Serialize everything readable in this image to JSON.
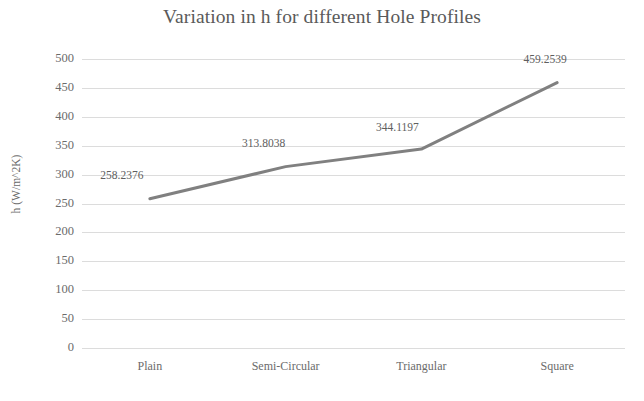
{
  "chart_data": {
    "type": "line",
    "title": "Variation in h for different Hole Profiles",
    "xlabel": "",
    "ylabel": "h (W/m^2K)",
    "categories": [
      "Plain",
      "Semi-Circular",
      "Triangular",
      "Square"
    ],
    "values": [
      258.2376,
      313.8038,
      344.1197,
      459.2539
    ],
    "data_labels": [
      "258.2376",
      "313.8038",
      "344.1197",
      "459.2539"
    ],
    "series": [
      {
        "name": "h",
        "values": [
          258.2376,
          313.8038,
          344.1197,
          459.2539
        ],
        "color": "#808080"
      }
    ],
    "ylim": [
      0,
      500
    ],
    "ytick_step": 50,
    "ytick_labels": [
      "500",
      "450",
      "400",
      "350",
      "300",
      "250",
      "200",
      "150",
      "100",
      "50",
      "0"
    ],
    "grid": {
      "horizontal": true,
      "vertical": false,
      "color": "#dcdcdc"
    },
    "legend": {
      "visible": false,
      "position": "none"
    },
    "markers": false,
    "line_width": 3,
    "colors": {
      "line": "#808080",
      "title_text": "#5a5a5a",
      "axis_text": "#6b6b6b",
      "data_label_text": "#5e5e5e",
      "gridline": "#dcdcdc",
      "background": "#ffffff"
    }
  }
}
